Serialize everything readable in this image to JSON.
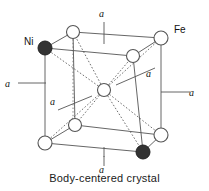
{
  "figure": {
    "title": "Body-centered crystal",
    "caption": "Body-centered crystal",
    "kind": "bcc-unit-cell-diagram",
    "colors": {
      "line": "#555555",
      "dashed": "#555555",
      "atom_open_fill": "#ffffff",
      "atom_open_stroke": "#555555",
      "atom_filled_fill": "#333333",
      "atom_filled_stroke": "#222222",
      "text": "#111111",
      "background": "#ffffff"
    },
    "element_labels": {
      "nickel": "Ni",
      "iron": "Fe"
    },
    "axis_labels": {
      "top": "a",
      "bottom": "a",
      "left": "a",
      "right": "a",
      "inner_left": "a",
      "inner_right": "a"
    },
    "atoms": [
      {
        "name": "front-top-left",
        "x": 45,
        "y": 48,
        "r": 7,
        "type": "filled",
        "element": "Ni"
      },
      {
        "name": "front-top-right",
        "x": 133,
        "y": 56,
        "r": 6.5,
        "type": "open",
        "element": "Fe"
      },
      {
        "name": "front-bottom-left",
        "x": 45,
        "y": 143,
        "r": 7,
        "type": "open",
        "element": "Fe"
      },
      {
        "name": "front-bottom-right",
        "x": 143,
        "y": 152,
        "r": 7,
        "type": "filled",
        "element": "Ni"
      },
      {
        "name": "back-top-left",
        "x": 73,
        "y": 32,
        "r": 6.5,
        "type": "open",
        "element": "Fe"
      },
      {
        "name": "back-top-right",
        "x": 161,
        "y": 38,
        "r": 7,
        "type": "open",
        "element": "Fe"
      },
      {
        "name": "back-bottom-left",
        "x": 75,
        "y": 125,
        "r": 6.5,
        "type": "open",
        "element": "Fe"
      },
      {
        "name": "back-bottom-right",
        "x": 161,
        "y": 135,
        "r": 7,
        "type": "open",
        "element": "Fe"
      },
      {
        "name": "body-center",
        "x": 104,
        "y": 90,
        "r": 6.5,
        "type": "open",
        "element": "Fe"
      }
    ]
  }
}
